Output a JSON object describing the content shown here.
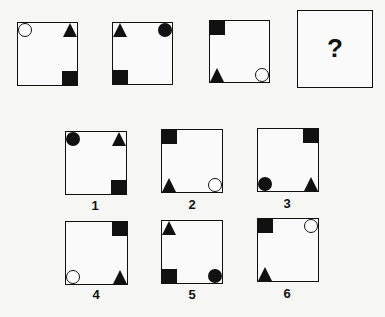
{
  "puzzle": {
    "sequence": [
      {
        "id": "seq-1",
        "shapes": [
          {
            "type": "circle",
            "fill": "open",
            "corner": "tl"
          },
          {
            "type": "triangle",
            "fill": "filled",
            "corner": "tr"
          },
          {
            "type": "square",
            "fill": "filled",
            "corner": "br"
          }
        ]
      },
      {
        "id": "seq-2",
        "shapes": [
          {
            "type": "triangle",
            "fill": "filled",
            "corner": "tl"
          },
          {
            "type": "circle",
            "fill": "filled",
            "corner": "tr"
          },
          {
            "type": "square",
            "fill": "filled",
            "corner": "bl"
          }
        ]
      },
      {
        "id": "seq-3",
        "shapes": [
          {
            "type": "square",
            "fill": "filled",
            "corner": "tl"
          },
          {
            "type": "triangle",
            "fill": "filled",
            "corner": "bl"
          },
          {
            "type": "circle",
            "fill": "open",
            "corner": "br"
          }
        ]
      },
      {
        "id": "seq-4",
        "question_mark": "?"
      }
    ],
    "options": [
      {
        "label": "1",
        "shapes": [
          {
            "type": "circle",
            "fill": "filled",
            "corner": "tl"
          },
          {
            "type": "triangle",
            "fill": "filled",
            "corner": "tr"
          },
          {
            "type": "square",
            "fill": "filled",
            "corner": "br"
          }
        ]
      },
      {
        "label": "2",
        "shapes": [
          {
            "type": "square",
            "fill": "filled",
            "corner": "tl"
          },
          {
            "type": "triangle",
            "fill": "filled",
            "corner": "bl"
          },
          {
            "type": "circle",
            "fill": "open",
            "corner": "br"
          }
        ]
      },
      {
        "label": "3",
        "shapes": [
          {
            "type": "square",
            "fill": "filled",
            "corner": "tr"
          },
          {
            "type": "circle",
            "fill": "filled",
            "corner": "bl"
          },
          {
            "type": "triangle",
            "fill": "filled",
            "corner": "br"
          }
        ]
      },
      {
        "label": "4",
        "shapes": [
          {
            "type": "square",
            "fill": "filled",
            "corner": "tr"
          },
          {
            "type": "circle",
            "fill": "open",
            "corner": "bl"
          },
          {
            "type": "triangle",
            "fill": "filled",
            "corner": "br"
          }
        ]
      },
      {
        "label": "5",
        "shapes": [
          {
            "type": "triangle",
            "fill": "filled",
            "corner": "tl"
          },
          {
            "type": "square",
            "fill": "filled",
            "corner": "bl"
          },
          {
            "type": "circle",
            "fill": "filled",
            "corner": "br"
          }
        ]
      },
      {
        "label": "6",
        "shapes": [
          {
            "type": "square",
            "fill": "filled",
            "corner": "tl"
          },
          {
            "type": "circle",
            "fill": "open",
            "corner": "tr"
          },
          {
            "type": "triangle",
            "fill": "filled",
            "corner": "bl"
          }
        ]
      }
    ]
  }
}
